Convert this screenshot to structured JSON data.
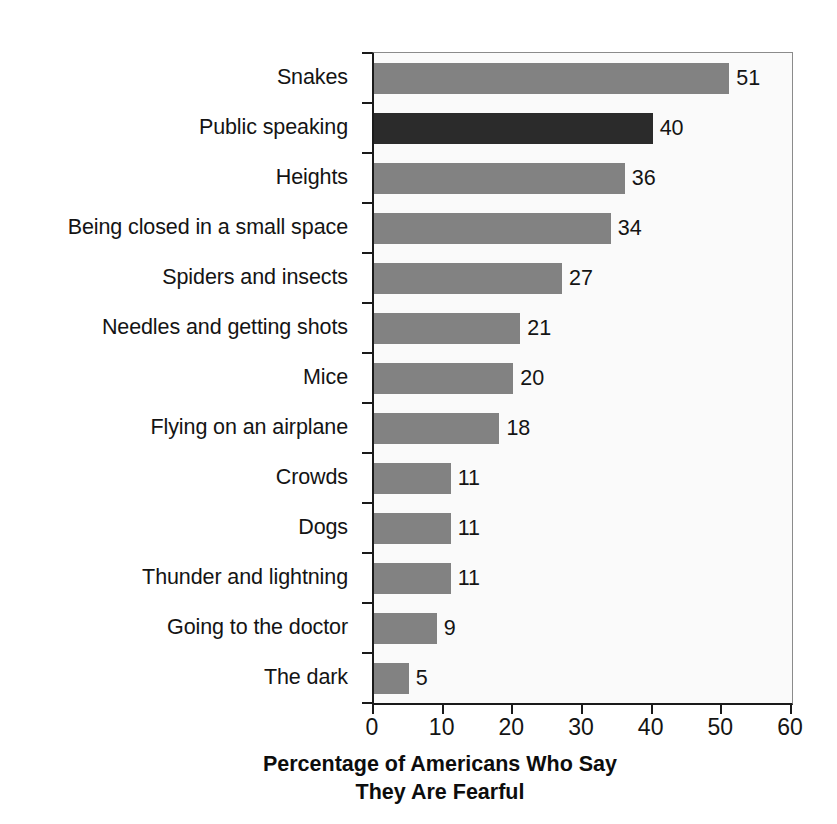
{
  "chart_data": {
    "type": "bar",
    "orientation": "horizontal",
    "title": "",
    "xlabel": "Percentage of Americans Who Say They Are Fearful",
    "xlabel_lines": [
      "Percentage of Americans Who Say",
      "They Are Fearful"
    ],
    "ylabel": "",
    "categories": [
      "Snakes",
      "Public speaking",
      "Heights",
      "Being closed in a small space",
      "Spiders and insects",
      "Needles and getting shots",
      "Mice",
      "Flying on an airplane",
      "Crowds",
      "Dogs",
      "Thunder and lightning",
      "Going to the doctor",
      "The dark"
    ],
    "values": [
      51,
      40,
      36,
      34,
      27,
      21,
      20,
      18,
      11,
      11,
      11,
      9,
      5
    ],
    "value_labels": [
      "51",
      "40",
      "36",
      "34",
      "27",
      "21",
      "20",
      "18",
      "11",
      "11",
      "11",
      "9",
      "5"
    ],
    "highlighted_category": "Public speaking",
    "highlighted_index": 1,
    "xlim": [
      0,
      60
    ],
    "xticks": [
      0,
      10,
      20,
      30,
      40,
      50,
      60
    ],
    "xtick_labels": [
      "0",
      "10",
      "20",
      "30",
      "40",
      "50",
      "60"
    ],
    "grid": false,
    "legend": null,
    "colors": {
      "bar": "#828282",
      "bar_highlight": "#2b2b2b",
      "axis": "#1a1a1a",
      "plot_background": "#fafafa",
      "page_background": "#ffffff",
      "text": "#141414"
    }
  }
}
